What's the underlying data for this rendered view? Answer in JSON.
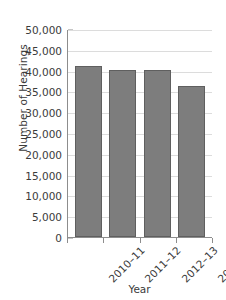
{
  "chart_data": {
    "type": "bar",
    "title": "",
    "categories": [
      "2010–11",
      "2011–12",
      "2012–13",
      "2013–14"
    ],
    "values": [
      41200,
      40100,
      40100,
      36200
    ],
    "xlabel": "Year",
    "ylabel": "Number of Hearings",
    "ylim": [
      0,
      50000
    ],
    "ytick_labels": [
      "50,000",
      "45,000",
      "40,000",
      "35,000",
      "30,000",
      "25,000",
      "20,000",
      "15,000",
      "10,000",
      "5,000",
      "0"
    ],
    "ytick_values": [
      50000,
      45000,
      40000,
      35000,
      30000,
      25000,
      20000,
      15000,
      10000,
      5000,
      0
    ],
    "grid": true,
    "legend": "none",
    "bar_color": "#7d7d7d",
    "bar_border_color": "#5f5f5f",
    "gridline_color": "#dcdcdc",
    "axis_color": "#8d8d8d",
    "text_color": "#3b3b3b",
    "background_color": "#ffffff"
  }
}
